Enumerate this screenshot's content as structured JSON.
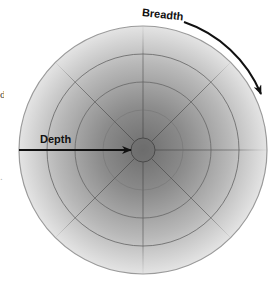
{
  "diagram": {
    "type": "concentric-polar-diagram",
    "labels": {
      "depth": "Depth",
      "breadth": "Breadth"
    },
    "geometry": {
      "center": [
        143,
        150
      ],
      "outer_radius": 124,
      "ring_radii": [
        40,
        68,
        96
      ],
      "core_radius": 12,
      "spoke_angles_deg": [
        0,
        45,
        90,
        135,
        180,
        225,
        270,
        315
      ]
    },
    "arrows": [
      {
        "name": "depth-arrow",
        "direction": "left-to-center",
        "label": "Depth"
      },
      {
        "name": "breadth-arrow",
        "direction": "clockwise-along-rim",
        "label": "Breadth"
      }
    ],
    "colors": {
      "center_shade": "#6e6e6e",
      "mid_shade": "#a8a8a8",
      "edge_shade": "#e4e4e4",
      "ring_stroke": "#6a6a6a",
      "outer_stroke": "#9a9a9a",
      "arrow": "#111111",
      "background": "#ffffff"
    }
  },
  "edge_fragments": {
    "top": "d",
    "bottom": "."
  }
}
